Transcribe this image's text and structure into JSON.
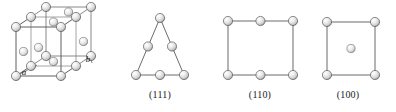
{
  "figure": {
    "background_color": "#ffffff",
    "line_color": "#6e6e6e",
    "sphere_fill_light": "#ffffff",
    "sphere_fill_mid": "#d8d8d8",
    "sphere_fill_dark": "#9a9a9a",
    "sphere_stroke": "#5a5a5a",
    "text_color": "#1a1a1a"
  },
  "panels": [
    {
      "id": "fcc-unit-cell",
      "name": "fcc-unit-cell",
      "caption": "",
      "shape": "cube",
      "atom_count": 14,
      "edge_labels": [
        {
          "text": "a",
          "x": 24,
          "y": 72
        },
        {
          "text": "b",
          "x": 88,
          "y": 59
        }
      ]
    },
    {
      "id": "plane-111",
      "name": "plane-111",
      "caption": "(111)",
      "caption_x": 160,
      "caption_y": 94,
      "shape": "triangle",
      "atom_count": 6
    },
    {
      "id": "plane-110",
      "name": "plane-110",
      "caption": "(110)",
      "caption_x": 260,
      "caption_y": 94,
      "shape": "rectangle",
      "atom_count": 6
    },
    {
      "id": "plane-100",
      "name": "plane-100",
      "caption": "(100)",
      "caption_x": 348,
      "caption_y": 94,
      "shape": "square",
      "atom_count": 5
    }
  ],
  "chart_data": {
    "type": "diagram",
    "panels": [
      {
        "label": "",
        "geometry": "cube",
        "description": "FCC unit cell: 8 corner atoms and 6 face-centre atoms",
        "atoms": 14
      },
      {
        "label": "(111)",
        "geometry": "triangle",
        "atoms": 6
      },
      {
        "label": "(110)",
        "geometry": "rectangle",
        "atoms": 6
      },
      {
        "label": "(100)",
        "geometry": "square",
        "atoms": 5
      }
    ]
  }
}
